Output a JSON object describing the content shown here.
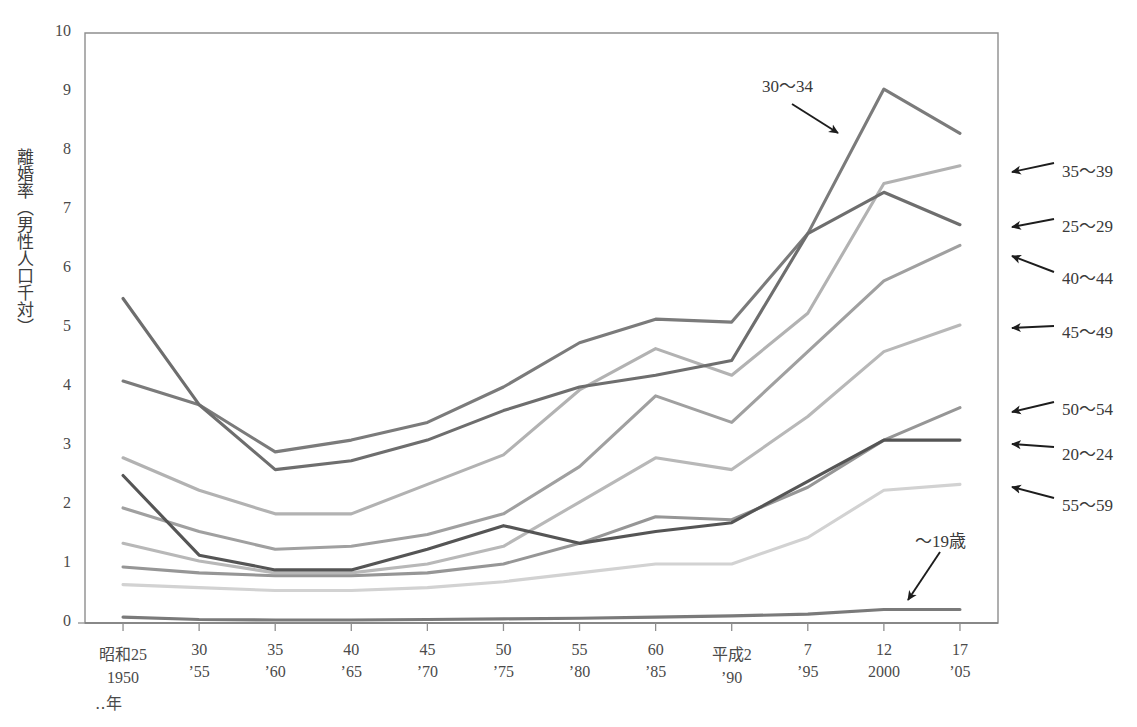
{
  "chart_data": {
    "type": "line",
    "title": "",
    "xlabel": "",
    "ylabel": "離婚率（男性人口千対）",
    "ylim": [
      0,
      10
    ],
    "yticks": [
      "0",
      "1",
      "2",
      "3",
      "4",
      "5",
      "6",
      "7",
      "8",
      "9",
      "10"
    ],
    "grid": false,
    "legend_position": "right-of-plot-annotations",
    "axis_note": "‥年",
    "categories": [
      {
        "era": "昭和25",
        "western": "1950"
      },
      {
        "era": "30",
        "western": "’55"
      },
      {
        "era": "35",
        "western": "’60"
      },
      {
        "era": "40",
        "western": "’65"
      },
      {
        "era": "45",
        "western": "’70"
      },
      {
        "era": "50",
        "western": "’75"
      },
      {
        "era": "55",
        "western": "’80"
      },
      {
        "era": "60",
        "western": "’85"
      },
      {
        "era": "平成2",
        "western": "’90"
      },
      {
        "era": "7",
        "western": "’95"
      },
      {
        "era": "12",
        "western": "2000"
      },
      {
        "era": "17",
        "western": "’05"
      }
    ],
    "series": [
      {
        "name": "30～34",
        "color": "#7b7b7b",
        "label_kind": "arrow-inside",
        "values": [
          4.1,
          3.7,
          2.9,
          3.1,
          3.4,
          4.0,
          4.75,
          5.15,
          5.1,
          6.6,
          9.05,
          8.3
        ]
      },
      {
        "name": "35～39",
        "color": "#b2b2b2",
        "label_kind": "arrow-right",
        "values": [
          2.8,
          2.25,
          1.85,
          1.85,
          2.35,
          2.85,
          3.95,
          4.65,
          4.2,
          5.25,
          7.45,
          7.75
        ]
      },
      {
        "name": "25～29",
        "color": "#6e6e6e",
        "label_kind": "arrow-right",
        "values": [
          5.5,
          3.7,
          2.6,
          2.75,
          3.1,
          3.6,
          4.0,
          4.2,
          4.45,
          6.6,
          7.3,
          6.75
        ]
      },
      {
        "name": "40～44",
        "color": "#a0a0a0",
        "label_kind": "arrow-right",
        "values": [
          1.95,
          1.55,
          1.25,
          1.3,
          1.5,
          1.85,
          2.65,
          3.85,
          3.4,
          4.6,
          5.8,
          6.4
        ]
      },
      {
        "name": "45～49",
        "color": "#b8b8b8",
        "label_kind": "arrow-right",
        "values": [
          1.35,
          1.05,
          0.85,
          0.85,
          1.0,
          1.3,
          2.05,
          2.8,
          2.6,
          3.5,
          4.6,
          5.05
        ]
      },
      {
        "name": "50～54",
        "color": "#969696",
        "label_kind": "arrow-right",
        "values": [
          0.95,
          0.85,
          0.8,
          0.8,
          0.85,
          1.0,
          1.35,
          1.8,
          1.75,
          2.3,
          3.1,
          3.65
        ]
      },
      {
        "name": "20～24",
        "color": "#555555",
        "label_kind": "arrow-right",
        "values": [
          2.5,
          1.15,
          0.9,
          0.9,
          1.25,
          1.65,
          1.35,
          1.55,
          1.7,
          2.4,
          3.1,
          3.1
        ]
      },
      {
        "name": "55～59",
        "color": "#d2d2d2",
        "label_kind": "arrow-right",
        "values": [
          0.65,
          0.6,
          0.55,
          0.55,
          0.6,
          0.7,
          0.85,
          1.0,
          1.0,
          1.45,
          2.25,
          2.35
        ]
      },
      {
        "name": "～19歳",
        "color": "#7a7a7a",
        "label_kind": "arrow-inside",
        "values": [
          0.1,
          0.06,
          0.05,
          0.05,
          0.06,
          0.07,
          0.08,
          0.1,
          0.12,
          0.15,
          0.23,
          0.23
        ]
      }
    ]
  },
  "plot": {
    "x_left": 85,
    "x_right": 998,
    "y_top": 33,
    "y_bottom": 623
  },
  "annotations": {
    "inside_arrows": [
      {
        "name": "30～34",
        "label_x": 762,
        "label_y": 72,
        "ax1": 792,
        "ay1": 104,
        "ax2": 838,
        "ay2": 133
      },
      {
        "name": "～19歳",
        "label_x": 915,
        "label_y": 527,
        "ax1": 940,
        "ay1": 552,
        "ax2": 908,
        "ay2": 600
      }
    ],
    "right_arrows": [
      {
        "name": "35～39",
        "label_x": 1062,
        "label_y": 157,
        "tail_x": 1054,
        "tail_y": 163,
        "head_x": 1012,
        "head_y": 172
      },
      {
        "name": "25～29",
        "label_x": 1062,
        "label_y": 212,
        "tail_x": 1054,
        "tail_y": 219,
        "head_x": 1012,
        "head_y": 227
      },
      {
        "name": "40～44",
        "label_x": 1062,
        "label_y": 264,
        "tail_x": 1054,
        "tail_y": 272,
        "head_x": 1012,
        "head_y": 256
      },
      {
        "name": "45～49",
        "label_x": 1062,
        "label_y": 318,
        "tail_x": 1054,
        "tail_y": 326,
        "head_x": 1012,
        "head_y": 328
      },
      {
        "name": "50～54",
        "label_x": 1062,
        "label_y": 395,
        "tail_x": 1054,
        "tail_y": 402,
        "head_x": 1012,
        "head_y": 412
      },
      {
        "name": "20～24",
        "label_x": 1062,
        "label_y": 440,
        "tail_x": 1054,
        "tail_y": 447,
        "head_x": 1012,
        "head_y": 444
      },
      {
        "name": "55～59",
        "label_x": 1062,
        "label_y": 491,
        "tail_x": 1054,
        "tail_y": 498,
        "head_x": 1012,
        "head_y": 487
      }
    ]
  }
}
